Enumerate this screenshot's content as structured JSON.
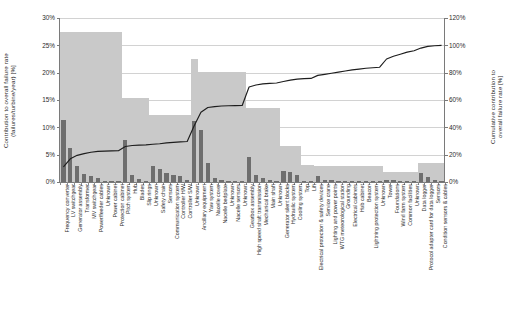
{
  "axes": {
    "left_title": "Contribution to overall failure rate\n(failures/turbine/year) [%]",
    "right_title": "Cumulative contribution to\noverall failure rate [%]",
    "left_ticks": [
      "30%",
      "25%",
      "20%",
      "15%",
      "10%",
      "5%",
      "0%"
    ],
    "right_ticks": [
      "120%",
      "100%",
      "80%",
      "60%",
      "40%",
      "20%",
      "0%"
    ]
  },
  "chart_data": {
    "type": "bar",
    "title": "",
    "xlabel": "",
    "ylabel": "Contribution to overall failure rate (failures/turbine/year) [%]",
    "y2label": "Cumulative contribution to overall failure rate [%]",
    "ylim": [
      0,
      30
    ],
    "y2lim": [
      0,
      120
    ],
    "grid": true,
    "legend": "none",
    "categories": [
      "Frequency converter",
      "LV switchgear",
      "Generator assembly",
      "Transformer",
      "MV switchgear",
      "Power/feeder cables",
      "Unknown",
      "Power cabinet",
      "Protection cabinet",
      "Pitch system",
      "Hub",
      "Blades",
      "Slip rings",
      "Unknown",
      "Safety chain",
      "Sensors",
      "Communication system",
      "Controller H/W",
      "Controller S/W",
      "Unknown",
      "Ancillary equipment",
      "Yaw system",
      "Nacelle cover",
      "Nacelle bedplate",
      "Unknown",
      "Nacelle sensors",
      "Unknown",
      "Gearbox assembly",
      "High speed shaft transmission",
      "Mechanical brake",
      "Main shaft",
      "Unknown",
      "Generator silent blocks",
      "Hydraulic system",
      "Cooling system",
      "Top",
      "Lift",
      "Electrical protection & safety devices",
      "Service crane",
      "Lighting and power points",
      "WTG meteorological station",
      "Grounding",
      "Electrical cabinets",
      "Hub cabinet",
      "Beacon",
      "Lightning protection system",
      "Unknown",
      "Tower",
      "Foundations",
      "Wind farm system",
      "Common facilities",
      "Unknown",
      "Data logger",
      "Protocol adapter card for data logger",
      "Sensors",
      "Condition sensors & cables"
    ],
    "series": [
      {
        "name": "Contribution to overall failure rate",
        "axis": "left",
        "unit": "%",
        "values": [
          11.3,
          6.3,
          3.0,
          1.5,
          1.1,
          0.7,
          0.25,
          0.15,
          0.1,
          7.6,
          1.2,
          0.55,
          0.15,
          3.0,
          2.3,
          1.6,
          1.3,
          1.1,
          0.35,
          11.2,
          9.5,
          3.4,
          0.8,
          0.35,
          0.2,
          0.15,
          0.1,
          4.6,
          1.2,
          0.7,
          0.45,
          0.2,
          2.0,
          1.8,
          1.3,
          0.25,
          0.2,
          1.1,
          0.35,
          0.3,
          0.25,
          0.2,
          0.2,
          0.15,
          0.15,
          0.1,
          0.1,
          0.35,
          0.3,
          0.25,
          0.2,
          0.15,
          1.7,
          0.9,
          0.35,
          0.25
        ]
      },
      {
        "name": "Cumulative contribution to overall failure rate",
        "axis": "right",
        "unit": "%",
        "values": [
          11.0,
          17.0,
          19.5,
          20.8,
          21.8,
          22.4,
          22.6,
          22.8,
          22.9,
          26.0,
          26.7,
          27.0,
          27.2,
          27.6,
          28.0,
          28.6,
          29.0,
          29.4,
          29.6,
          41.0,
          51.0,
          54.5,
          55.2,
          55.6,
          55.8,
          55.9,
          56.0,
          69.5,
          71.0,
          71.8,
          72.2,
          72.4,
          73.5,
          74.5,
          75.3,
          75.6,
          75.8,
          78.0,
          78.8,
          79.6,
          80.4,
          81.2,
          82.0,
          82.6,
          83.2,
          83.6,
          84.0,
          90.0,
          92.0,
          93.5,
          95.0,
          96.0,
          98.0,
          99.2,
          99.7,
          100.0
        ]
      }
    ],
    "group_totals": [
      {
        "label": "Electrical system",
        "value": 27.5,
        "span": [
          0,
          8
        ]
      },
      {
        "label": "Rotor system",
        "value": 15.3,
        "span": [
          9,
          12
        ]
      },
      {
        "label": "Control & communication",
        "value": 12.2,
        "span": [
          13,
          18
        ]
      },
      {
        "label": "Generator",
        "value": 22.5,
        "span": [
          19,
          19
        ]
      },
      {
        "label": "Nacelle",
        "value": 20.1,
        "span": [
          20,
          26
        ]
      },
      {
        "label": "Drive train",
        "value": 13.6,
        "span": [
          27,
          31
        ]
      },
      {
        "label": "Auxiliary systems",
        "value": 6.5,
        "span": [
          32,
          34
        ]
      },
      {
        "label": "Structure access",
        "value": 3.2,
        "span": [
          35,
          36
        ]
      },
      {
        "label": "Electrical components",
        "value": 3.0,
        "span": [
          37,
          46
        ]
      },
      {
        "label": "Structure",
        "value": 1.8,
        "span": [
          47,
          51
        ]
      },
      {
        "label": "Monitoring",
        "value": 3.4,
        "span": [
          52,
          55
        ]
      }
    ]
  }
}
